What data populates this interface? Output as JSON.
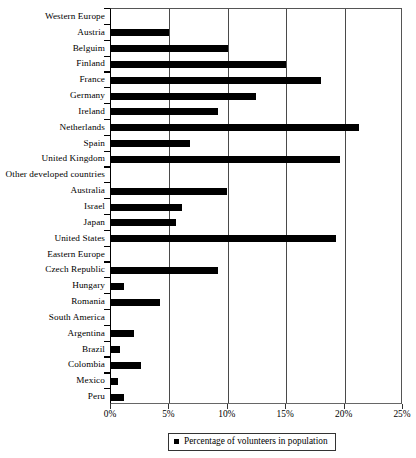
{
  "chart_data": {
    "type": "bar",
    "orientation": "horizontal",
    "title": "",
    "xlabel": "",
    "ylabel": "",
    "xlim": [
      0,
      25
    ],
    "xunit": "%",
    "grid": true,
    "legend_position": "bottom-center",
    "tick_labels": [
      "0%",
      "5%",
      "10%",
      "15%",
      "20%",
      "25%"
    ],
    "tick_values": [
      0,
      5,
      10,
      15,
      20,
      25
    ],
    "legend": [
      "Percentage of volunteers in population"
    ],
    "series_name": "Percentage of volunteers in population",
    "categories": [
      "Western Europe",
      "Austria",
      "Belguim",
      "Finland",
      "France",
      "Germany",
      "Ireland",
      "Netherlands",
      "Spain",
      "United Kingdom",
      "Other developed countries",
      "Australia",
      "Israel",
      "Japan",
      "United States",
      "Eastern Europe",
      "Czech Republic",
      "Hungary",
      "Romania",
      "South America",
      "Argentina",
      "Brazil",
      "Colombia",
      "Mexico",
      "Peru"
    ],
    "values": [
      null,
      5.0,
      10.0,
      15.0,
      18.0,
      12.4,
      9.2,
      21.2,
      6.8,
      19.6,
      null,
      9.9,
      6.1,
      5.6,
      19.3,
      null,
      9.2,
      1.1,
      4.2,
      null,
      2.0,
      0.8,
      2.6,
      0.6,
      1.1
    ],
    "group_headers": [
      "Western Europe",
      "Other developed countries",
      "Eastern Europe",
      "South America"
    ],
    "bar_color": "#000000"
  }
}
